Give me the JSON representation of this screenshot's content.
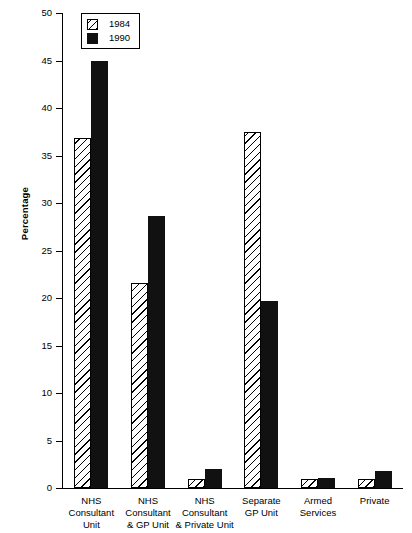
{
  "chart_data": {
    "type": "bar",
    "title": "",
    "xlabel": "",
    "ylabel": "Percentage",
    "ylim": [
      0,
      50
    ],
    "yticks": [
      0,
      5,
      10,
      15,
      20,
      25,
      30,
      35,
      40,
      45,
      50
    ],
    "ytick_labels": [
      "0",
      "5",
      "10",
      "15",
      "20",
      "25",
      "30",
      "35",
      "40",
      "45",
      "50"
    ],
    "grid": false,
    "legend_position": "top-left",
    "categories": [
      "NHS\nConsultant\nUnit",
      "NHS\nConsultant\n& GP Unit",
      "NHS\nConsultant\n& Private Unit",
      "Separate\nGP Unit",
      "Armed\nServices",
      "Private"
    ],
    "series": [
      {
        "name": "1984",
        "pattern": "diagonal-hatch",
        "color": "#000000",
        "values": [
          36.8,
          21.6,
          1.0,
          37.5,
          1.0,
          1.0
        ]
      },
      {
        "name": "1990",
        "pattern": "solid",
        "color": "#111111",
        "values": [
          45.0,
          28.6,
          2.0,
          19.7,
          1.1,
          1.8
        ]
      }
    ]
  },
  "legend": {
    "entries": [
      {
        "label": "1984",
        "swatch": "hatched-swatch"
      },
      {
        "label": "1990",
        "swatch": "solid-black-swatch"
      }
    ]
  }
}
